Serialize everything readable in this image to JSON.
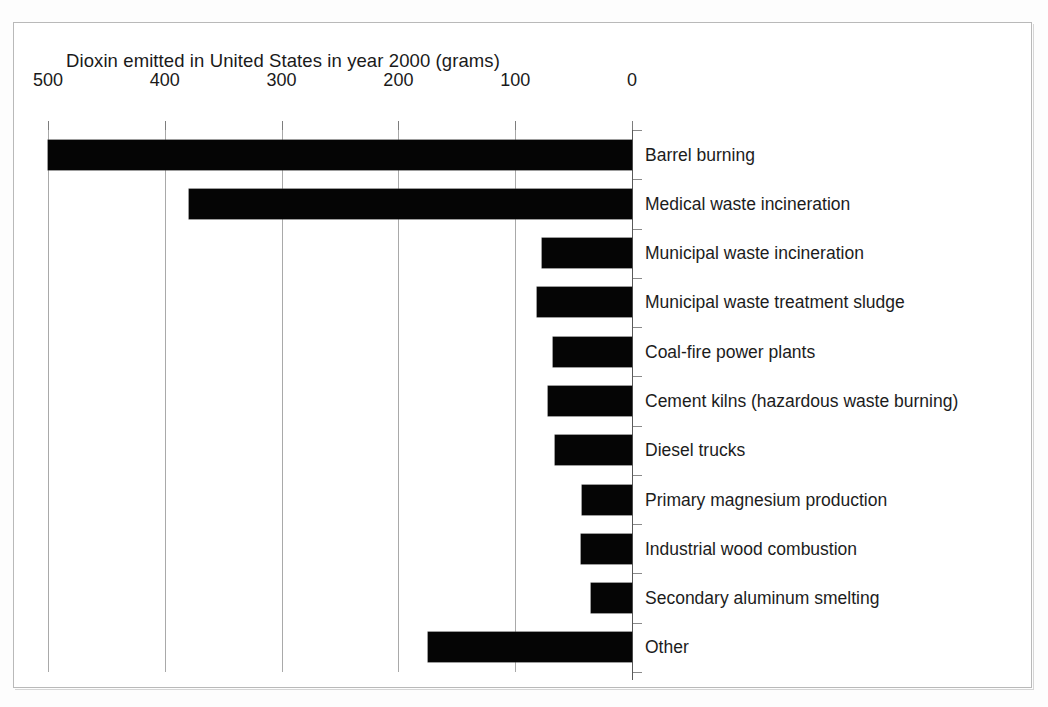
{
  "chart_data": {
    "type": "bar",
    "orientation": "horizontal",
    "title": "Dioxin emitted in United States in year 2000 (grams)",
    "xlabel": "",
    "ylabel": "",
    "xlim": [
      500,
      0
    ],
    "x_axis_reversed": true,
    "grid": true,
    "legend": "none",
    "tick_labels": [
      "500",
      "400",
      "300",
      "200",
      "100",
      "0"
    ],
    "tick_values": [
      500,
      400,
      300,
      200,
      100,
      0
    ],
    "bar_color": "#050505",
    "categories": [
      "Barrel burning",
      "Medical waste incineration",
      "Municipal waste incineration",
      "Municipal waste treatment sludge",
      "Coal-fire power plants",
      "Cement kilns (hazardous waste burning)",
      "Diesel trucks",
      "Primary magnesium production",
      "Industrial wood combustion",
      "Secondary aluminum smelting",
      "Other"
    ],
    "values": [
      500,
      379,
      77,
      81,
      68,
      72,
      66,
      43,
      44,
      35,
      175
    ]
  }
}
